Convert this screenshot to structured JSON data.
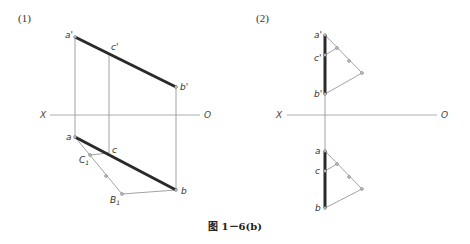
{
  "figure": {
    "caption": "图 1－6(b)"
  },
  "panel1": {
    "label": "(1)",
    "axis": {
      "left": "X",
      "right": "O"
    },
    "front_view": {
      "a_prime": "a'",
      "c_prime": "c'",
      "b_prime": "b'"
    },
    "top_view": {
      "a": "a",
      "c": "c",
      "b": "b",
      "C1": "C",
      "C1_sub": "1",
      "B1": "B",
      "B1_sub": "1"
    }
  },
  "panel2": {
    "label": "(2)",
    "axis": {
      "left": "X",
      "right": "O"
    },
    "front_view": {
      "a_prime": "a'",
      "c_prime": "c'",
      "b_prime": "b'"
    },
    "top_view": {
      "a": "a",
      "c": "c",
      "b": "b"
    }
  }
}
